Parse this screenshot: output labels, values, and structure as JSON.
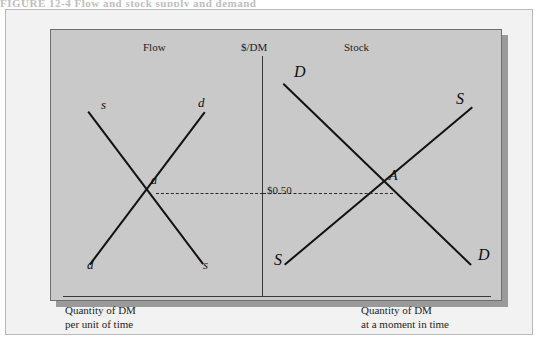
{
  "scan": {
    "top_caption": "FIGURE 12-4  Flow and stock supply and demand"
  },
  "figure": {
    "titles": {
      "left_panel": "Flow",
      "price_axis": "$/DM",
      "right_panel": "Stock"
    },
    "equilibrium_price": "$0.50",
    "captions": {
      "left_line1": "Quantity of DM",
      "left_line2": "per unit of time",
      "right_line1": "Quantity of DM",
      "right_line2": "at a moment in time"
    },
    "left_panel": {
      "equilibrium_point": "a",
      "supply_label_top": "s",
      "supply_label_bottom": "s",
      "demand_label_top": "d",
      "demand_label_bottom": "d"
    },
    "right_panel": {
      "equilibrium_point": "A",
      "supply_label_top": "S",
      "supply_label_bottom": "S",
      "demand_label_top": "D",
      "demand_label_bottom": "D"
    }
  },
  "colors": {
    "panel_background": "#c9c9c9",
    "page_background": "#f2f2f2",
    "curve": "#111111",
    "axis": "#3a3a3a"
  }
}
